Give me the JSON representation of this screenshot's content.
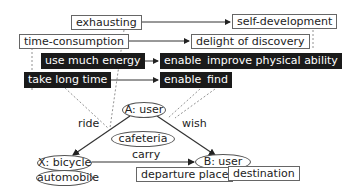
{
  "nodes": {
    "exhausting": "exhausting",
    "self_development": "self-development",
    "time_consumption": "time-consumption",
    "delight_of_discovery": "delight of discovery",
    "use_much_energy": "use much energy",
    "enable_1": "enable",
    "improve_physical_ability": "improve physical ability",
    "take_long_time": "take long time",
    "enable_2": "enable",
    "find": "find",
    "a_user": "A: user",
    "cafeteria": "cafeteria",
    "x_bicycle": "X: bicycle",
    "automobile": "automobile",
    "b_user": "B: user",
    "departure_place": "departure place",
    "destination": "destination"
  },
  "edges": {
    "ride": "ride",
    "wish": "wish",
    "carry": "carry"
  },
  "colors": {
    "dark_box": "#1a1a1a",
    "line": "#333333",
    "dashed": "#777777"
  }
}
